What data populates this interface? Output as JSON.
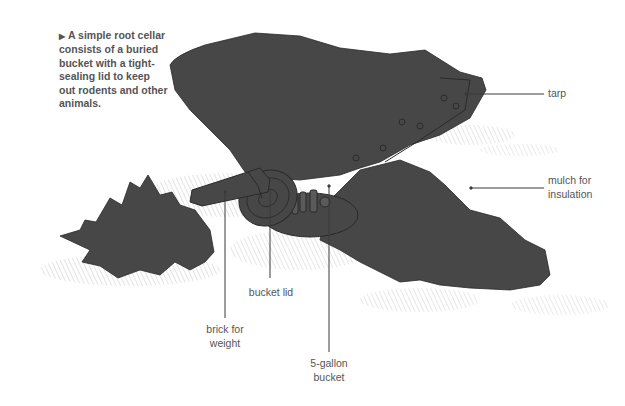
{
  "caption": {
    "marker": "▶",
    "text": "A simple root cellar consists of a buried bucket with a tight-sealing lid to keep out rodents and other animals."
  },
  "labels": {
    "tarp": "tarp",
    "mulch_line1": "mulch for",
    "mulch_line2": "insulation",
    "bucket_lid": "bucket lid",
    "brick_line1": "brick for",
    "brick_line2": "weight",
    "bucket_line1": "5-gallon",
    "bucket_line2": "bucket"
  },
  "colors": {
    "illustration_fill": "#474747",
    "line_art": "#2a2a2a",
    "leader_line": "#3a3a3a",
    "text": "#555555"
  }
}
